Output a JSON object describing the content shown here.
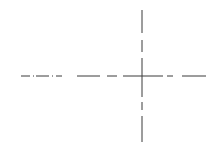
{
  "drawing": {
    "type": "centerline-crosshair",
    "stroke_color": "#3a3a3a",
    "center": {
      "x": 142,
      "y": 76
    },
    "horizontal_segments": [
      [
        21,
        30
      ],
      [
        33,
        34
      ],
      [
        36,
        49
      ],
      [
        52,
        53
      ],
      [
        56,
        62
      ],
      [
        77,
        100
      ],
      [
        107,
        117
      ],
      [
        123,
        163
      ],
      [
        167,
        173
      ],
      [
        182,
        206
      ]
    ],
    "vertical_segments": [
      [
        10,
        33
      ],
      [
        40,
        52
      ],
      [
        58,
        97
      ],
      [
        102,
        110
      ],
      [
        116,
        142
      ]
    ]
  }
}
